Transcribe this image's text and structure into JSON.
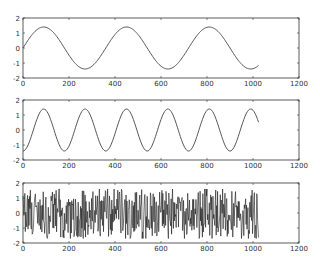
{
  "chart_data": [
    {
      "type": "line",
      "title": "",
      "xlabel": "",
      "ylabel": "",
      "xlim": [
        0,
        1200
      ],
      "ylim": [
        -2,
        2
      ],
      "x_ticks": [
        "0",
        "200",
        "400",
        "600",
        "800",
        "1000",
        "1200"
      ],
      "y_ticks": [
        "2",
        "1",
        "0",
        "-1",
        "-2"
      ],
      "grid": false,
      "legend": null,
      "series": [
        {
          "name": "sine (slow)",
          "function": "1.4*sin(2*pi*x/360)",
          "x_range": [
            0,
            1024
          ],
          "amplitude": 1.4,
          "period": 360,
          "start_value": 0,
          "end_value": -1.16
        }
      ]
    },
    {
      "type": "line",
      "title": "",
      "xlabel": "",
      "ylabel": "",
      "xlim": [
        0,
        1200
      ],
      "ylim": [
        -2,
        2
      ],
      "x_ticks": [
        "0",
        "200",
        "400",
        "600",
        "800",
        "1000",
        "1200"
      ],
      "y_ticks": [
        "2",
        "1",
        "0",
        "-1",
        "-2"
      ],
      "grid": false,
      "legend": null,
      "series": [
        {
          "name": "sine (fast)",
          "function": "-1.4*cos(2*pi*x/180)",
          "x_range": [
            0,
            1024
          ],
          "amplitude": 1.4,
          "period": 180,
          "start_value": -1.4,
          "end_value": 0.5
        }
      ]
    },
    {
      "type": "line",
      "title": "",
      "xlabel": "",
      "ylabel": "",
      "xlim": [
        0,
        1200
      ],
      "ylim": [
        -2,
        2
      ],
      "x_ticks": [
        "0",
        "200",
        "400",
        "600",
        "800",
        "1000",
        "1200"
      ],
      "y_ticks": [
        "2",
        "1",
        "0",
        "-1",
        "-2"
      ],
      "grid": false,
      "legend": null,
      "series": [
        {
          "name": "noise",
          "function": "random noise",
          "x_range": [
            0,
            1024
          ],
          "value_range": [
            -1.7,
            1.6
          ]
        }
      ]
    }
  ],
  "axes": [
    {
      "top": 18,
      "bottom": 78
    },
    {
      "top": 100,
      "bottom": 160
    },
    {
      "top": 183,
      "bottom": 243
    }
  ],
  "layout": {
    "left": 23,
    "right": 299,
    "line_color": "#444444",
    "noise_color": "#1a1a1a",
    "axis_color": "#333333"
  }
}
